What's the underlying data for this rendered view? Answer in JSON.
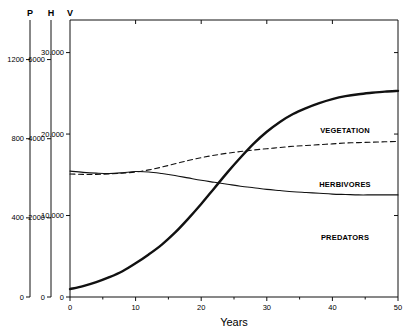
{
  "figure": {
    "xaxis_title": "Years",
    "caption": "Figure 11-7. Model Yield. Dynamics for Population of Predators and Their Prey."
  },
  "chart_data": {
    "type": "line",
    "title": "",
    "xlabel": "Years",
    "ylabel": "",
    "xlim": [
      0,
      50
    ],
    "grid": false,
    "legend_position": "inline-right",
    "x_ticks": [
      "0",
      "10",
      "20",
      "30",
      "40",
      "50"
    ],
    "x_tick_values": [
      0,
      10,
      20,
      30,
      40,
      50
    ],
    "x_minor_ticks": [
      5,
      15,
      25,
      35,
      45
    ],
    "axes": [
      {
        "key": "P",
        "label": "P",
        "name": "predators-axis",
        "ticks": [
          "0",
          "400",
          "800",
          "1200"
        ],
        "tick_values": [
          0,
          400,
          800,
          1200
        ],
        "range": [
          0,
          1400
        ]
      },
      {
        "key": "H",
        "label": "H",
        "name": "herbivores-axis",
        "ticks": [
          "0",
          "2000",
          "4000",
          "6000"
        ],
        "tick_values": [
          0,
          2000,
          4000,
          6000
        ],
        "range": [
          0,
          7000
        ]
      },
      {
        "key": "V",
        "label": "V",
        "name": "vegetation-axis",
        "ticks": [
          "0",
          "10.000",
          "20.000",
          "30.000"
        ],
        "tick_values": [
          0,
          10000,
          20000,
          30000
        ],
        "range": [
          0,
          34000
        ]
      }
    ],
    "series": [
      {
        "name": "VEGETATION",
        "label": "VEGETATION",
        "style": "dashed",
        "width": 1.1,
        "axis": "V",
        "x": [
          0,
          2,
          4,
          6,
          8,
          10,
          12,
          14,
          16,
          18,
          20,
          22,
          24,
          26,
          28,
          30,
          32,
          34,
          36,
          38,
          40,
          42,
          44,
          46,
          48,
          50
        ],
        "values": [
          15100,
          15050,
          15050,
          15100,
          15200,
          15350,
          15600,
          15950,
          16350,
          16750,
          17100,
          17400,
          17650,
          17850,
          18050,
          18200,
          18350,
          18500,
          18600,
          18700,
          18800,
          18900,
          18950,
          19000,
          19050,
          19100
        ]
      },
      {
        "name": "HERBIVORES",
        "label": "HERBIVORES",
        "style": "solid",
        "width": 1.1,
        "axis": "H",
        "x": [
          0,
          2,
          4,
          6,
          8,
          10,
          12,
          14,
          16,
          18,
          20,
          22,
          24,
          26,
          28,
          30,
          32,
          34,
          36,
          38,
          40,
          42,
          44,
          46,
          48,
          50
        ],
        "values": [
          3180,
          3150,
          3130,
          3120,
          3140,
          3170,
          3160,
          3120,
          3070,
          3010,
          2950,
          2900,
          2850,
          2800,
          2760,
          2720,
          2690,
          2660,
          2640,
          2620,
          2600,
          2590,
          2580,
          2580,
          2580,
          2580
        ]
      },
      {
        "name": "PREDATORS",
        "label": "PREDATORS",
        "style": "solid-thick",
        "width": 2.4,
        "axis": "P",
        "x": [
          0,
          2,
          4,
          6,
          8,
          10,
          12,
          14,
          16,
          18,
          20,
          22,
          24,
          26,
          28,
          30,
          32,
          34,
          36,
          38,
          40,
          42,
          44,
          46,
          48,
          50
        ],
        "values": [
          40,
          55,
          75,
          100,
          130,
          170,
          215,
          265,
          325,
          395,
          470,
          550,
          630,
          705,
          775,
          835,
          885,
          925,
          955,
          980,
          1000,
          1015,
          1025,
          1032,
          1038,
          1042
        ]
      }
    ]
  },
  "colors": {
    "ink": "#111111",
    "background": "#ffffff"
  }
}
